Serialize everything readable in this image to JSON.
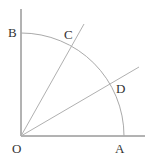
{
  "diagram": {
    "labels": {
      "O": "O",
      "A": "A",
      "B": "B",
      "C": "C",
      "D": "D"
    },
    "colors": {
      "axis": "#666666",
      "arc": "#a8a8a8",
      "rays": "#b0b0b0",
      "text": "#333333"
    }
  }
}
